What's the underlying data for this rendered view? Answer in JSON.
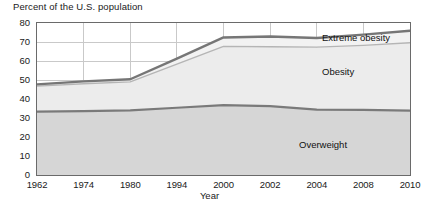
{
  "chart_data": {
    "type": "area",
    "title": "Percent of the U.S. population",
    "xlabel": "Year",
    "ylabel": "",
    "ylim": [
      0,
      80
    ],
    "ytick_values": [
      0,
      10,
      20,
      30,
      40,
      50,
      60,
      70,
      80
    ],
    "ytick_labels": [
      "0",
      "10",
      "20",
      "30",
      "40",
      "50",
      "60",
      "70",
      "80"
    ],
    "categories": [
      "1962",
      "1974",
      "1980",
      "1994",
      "2000",
      "2002",
      "2004",
      "2008",
      "2010"
    ],
    "grid": true,
    "legend_position": "inline-band-labels",
    "stacked": true,
    "annotations": [
      "Extreme obesity",
      "Obesity",
      "Overweight"
    ],
    "series": [
      {
        "name": "Overweight",
        "label": "Overweight",
        "color": "#d6d6d6",
        "line_color": "#7a7a7a",
        "values": [
          33.4,
          33.6,
          34.0,
          35.4,
          36.8,
          36.2,
          34.4,
          34.3,
          33.9
        ]
      },
      {
        "name": "Obesity",
        "label": "Obesity",
        "color": "#ececec",
        "line_color": "#b5b5b5",
        "values": [
          13.4,
          14.4,
          15.0,
          23.0,
          30.9,
          31.3,
          32.9,
          33.9,
          35.7
        ],
        "cumulative_values": [
          46.8,
          48.0,
          49.0,
          58.4,
          67.7,
          67.5,
          67.3,
          68.2,
          69.6
        ]
      },
      {
        "name": "Extreme obesity",
        "label": "Extreme obesity",
        "color": "#f2f2f2",
        "line_color": "#767676",
        "values": [
          0.9,
          1.3,
          1.4,
          2.9,
          4.7,
          5.4,
          4.8,
          5.7,
          6.3
        ],
        "cumulative_values": [
          47.7,
          49.3,
          50.4,
          61.3,
          72.4,
          72.9,
          72.1,
          73.9,
          75.9
        ]
      }
    ]
  }
}
